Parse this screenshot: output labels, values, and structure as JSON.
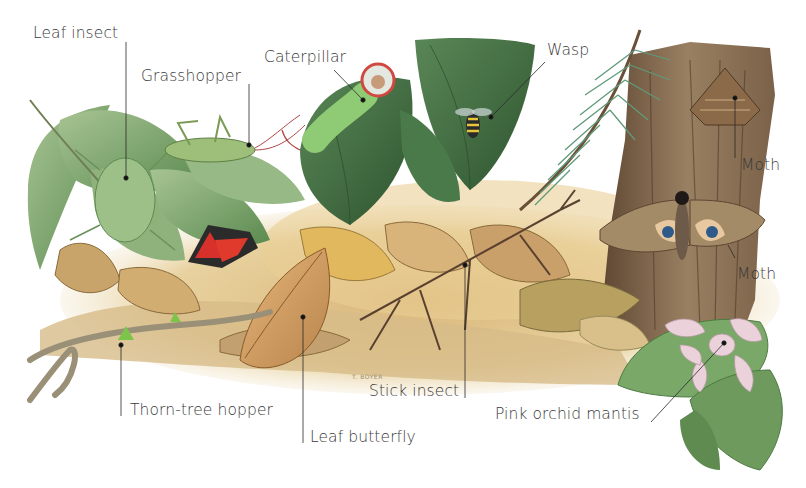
{
  "illustration": {
    "subject": "Camouflaged insects among leaves, bark and leaf litter",
    "artist_signature": "T. BOYER",
    "colors": {
      "background": "#ffffff",
      "label_text": "#3a3a3a",
      "leader_line": "#2a2a2a",
      "leaf_green": "#6f9a5e",
      "dark_leaf_green": "#3f6b3e",
      "litter_tan": "#c9a46a",
      "bark_brown": "#8a6f4f",
      "moth_red": "#d8302a",
      "orchid_pink": "#ead0d8"
    }
  },
  "labels": [
    {
      "id": "leaf-insect",
      "text": "Leaf insect"
    },
    {
      "id": "grasshopper",
      "text": "Grasshopper"
    },
    {
      "id": "caterpillar",
      "text": "Caterpillar"
    },
    {
      "id": "wasp",
      "text": "Wasp"
    },
    {
      "id": "moth-upper",
      "text": "Moth"
    },
    {
      "id": "moth-lower",
      "text": "Moth"
    },
    {
      "id": "thorn-tree-hopper",
      "text": "Thorn-tree hopper"
    },
    {
      "id": "leaf-butterfly",
      "text": "Leaf butterfly"
    },
    {
      "id": "stick-insect",
      "text": "Stick insect"
    },
    {
      "id": "pink-orchid-mantis",
      "text": "Pink orchid mantis"
    }
  ]
}
